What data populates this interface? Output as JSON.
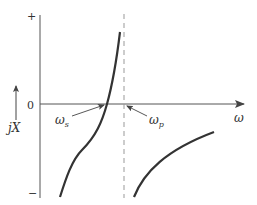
{
  "diagram": {
    "y_axis": {
      "plus_label": "+",
      "minus_label": "−",
      "zero_label": "0",
      "quantity_label": "jX"
    },
    "x_axis": {
      "label": "ω"
    },
    "annotations": {
      "series_resonance": {
        "symbol": "ω",
        "subscript": "s"
      },
      "parallel_resonance": {
        "symbol": "ω",
        "subscript": "p"
      }
    },
    "colors": {
      "curve": "#333333",
      "axis": "#555555",
      "dashed": "#999999"
    }
  }
}
